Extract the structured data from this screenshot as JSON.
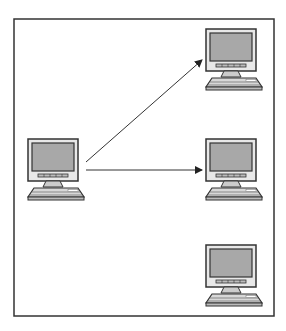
{
  "diagram": {
    "frame": {
      "x": 14,
      "y": 19,
      "width": 260,
      "height": 297,
      "stroke": "#333333"
    },
    "colors": {
      "screen": "#a8a8a8",
      "bezel": "#e6e6e6",
      "outline": "#333333",
      "keyboard": "#d8d8d8",
      "arrow": "#333333"
    },
    "nodes": [
      {
        "id": "source",
        "label": "",
        "x": 25,
        "y": 139
      },
      {
        "id": "target-top",
        "label": "",
        "x": 203,
        "y": 29
      },
      {
        "id": "target-middle",
        "label": "",
        "x": 203,
        "y": 139
      },
      {
        "id": "target-bottom",
        "label": "",
        "x": 203,
        "y": 245
      }
    ],
    "edges": [
      {
        "from": "source",
        "to": "target-top",
        "x1": 86,
        "y1": 162,
        "x2": 203,
        "y2": 60
      },
      {
        "from": "source",
        "to": "target-middle",
        "x1": 86,
        "y1": 170,
        "x2": 203,
        "y2": 170
      }
    ]
  }
}
